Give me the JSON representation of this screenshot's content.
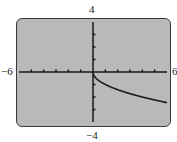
{
  "window": {
    "ymax_label": "4",
    "ymin_label": "-4",
    "xmin_label": "-6",
    "xmax_label": "6"
  },
  "colors": {
    "background": "#b9b9b9",
    "frame": "#3a3a3a",
    "axis": "#1a1a1a",
    "curve": "#1a1a1a"
  },
  "chart_data": {
    "type": "line",
    "title": "",
    "xlabel": "",
    "ylabel": "",
    "xlim": [
      -6,
      6
    ],
    "ylim": [
      -4,
      4
    ],
    "xticks_step": 1,
    "yticks_step": 1,
    "grid": false,
    "legend": null,
    "series": [
      {
        "name": "y = -sqrt(x)",
        "x": [
          0,
          0.25,
          0.5,
          1,
          1.5,
          2,
          2.5,
          3,
          3.5,
          4,
          4.5,
          5,
          5.5,
          6
        ],
        "y": [
          0,
          -0.5,
          -0.71,
          -1,
          -1.22,
          -1.41,
          -1.58,
          -1.73,
          -1.87,
          -2,
          -2.12,
          -2.24,
          -2.35,
          -2.45
        ]
      }
    ],
    "annotations": [
      "-6",
      "6",
      "4",
      "-4"
    ]
  }
}
